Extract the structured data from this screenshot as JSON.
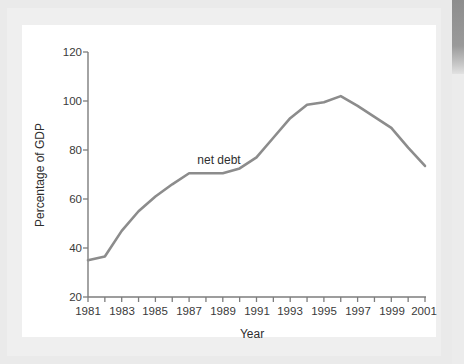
{
  "chart_data": {
    "type": "line",
    "title": "",
    "xlabel": "Year",
    "ylabel": "Percentage of GDP",
    "xlim": [
      1981,
      2001
    ],
    "ylim": [
      20,
      120
    ],
    "grid": false,
    "legend_position": "inline-annotation",
    "y_ticks": [
      20,
      40,
      60,
      80,
      100,
      120
    ],
    "x_ticks": [
      1981,
      1982,
      1983,
      1984,
      1985,
      1986,
      1987,
      1988,
      1989,
      1990,
      1991,
      1992,
      1993,
      1994,
      1995,
      1996,
      1997,
      1998,
      1999,
      2000,
      2001
    ],
    "x_tick_labels": [
      "1981",
      "",
      "1983",
      "",
      "1985",
      "",
      "1987",
      "",
      "1989",
      "",
      "1991",
      "",
      "1993",
      "",
      "1995",
      "",
      "1997",
      "",
      "1999",
      "",
      "2001"
    ],
    "annotations": [
      {
        "text": "net debt",
        "x": 1987,
        "y": 77
      }
    ],
    "series": [
      {
        "name": "net debt",
        "color": "#8c8c8c",
        "x": [
          1981,
          1982,
          1983,
          1984,
          1985,
          1986,
          1987,
          1988,
          1989,
          1990,
          1991,
          1992,
          1993,
          1994,
          1995,
          1996,
          1997,
          1998,
          1999,
          2000,
          2001
        ],
        "values": [
          35.0,
          36.5,
          47.0,
          55.0,
          61.0,
          66.0,
          70.5,
          70.5,
          70.5,
          72.5,
          77.0,
          85.0,
          93.0,
          98.5,
          99.5,
          102.0,
          98.0,
          93.5,
          89.0,
          81.0,
          73.5
        ]
      }
    ]
  },
  "axis": {
    "y_title": "Percentage of GDP",
    "x_title": "Year",
    "y_tick_0": "20",
    "y_tick_1": "40",
    "y_tick_2": "60",
    "y_tick_3": "80",
    "y_tick_4": "100",
    "y_tick_5": "120",
    "x_tick_1981": "1981",
    "x_tick_1983": "1983",
    "x_tick_1985": "1985",
    "x_tick_1987": "1987",
    "x_tick_1989": "1989",
    "x_tick_1991": "1991",
    "x_tick_1993": "1993",
    "x_tick_1995": "1995",
    "x_tick_1997": "1997",
    "x_tick_1999": "1999",
    "x_tick_2001": "2001"
  },
  "annotation": {
    "net_debt_label": "net debt"
  },
  "colors": {
    "series_line": "#8c8c8c",
    "axis": "#7d7d7d",
    "text": "#2e2e2e",
    "card_background": "#ffffff",
    "page_background": "#eaeaea"
  }
}
